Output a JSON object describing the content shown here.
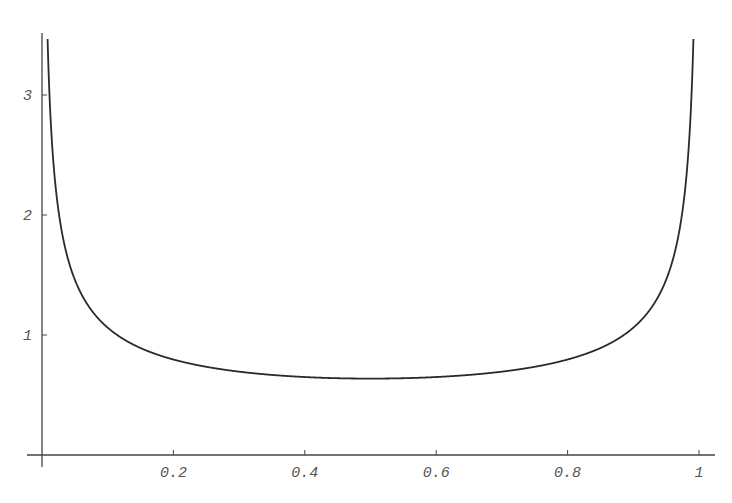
{
  "chart_data": {
    "type": "line",
    "title": "",
    "xlabel": "",
    "ylabel": "",
    "function": "1/(pi*sqrt(x*(1-x)))",
    "xlim": [
      0,
      1
    ],
    "ylim": [
      0,
      3.5
    ],
    "grid": false,
    "legend": null,
    "x_ticks": [
      {
        "value": 0.2,
        "label": "0.2"
      },
      {
        "value": 0.4,
        "label": "0.4"
      },
      {
        "value": 0.6,
        "label": "0.6"
      },
      {
        "value": 0.8,
        "label": "0.8"
      },
      {
        "value": 1,
        "label": "1"
      }
    ],
    "y_ticks": [
      {
        "value": 1,
        "label": "1"
      },
      {
        "value": 2,
        "label": "2"
      },
      {
        "value": 3,
        "label": "3"
      }
    ],
    "series": [
      {
        "name": "curve",
        "x": [
          0.01,
          0.02,
          0.05,
          0.1,
          0.2,
          0.3,
          0.4,
          0.5,
          0.6,
          0.7,
          0.8,
          0.9,
          0.95,
          0.98,
          0.99
        ],
        "y": [
          3.2,
          2.27,
          1.46,
          1.06,
          0.8,
          0.69,
          0.65,
          0.64,
          0.65,
          0.69,
          0.8,
          1.06,
          1.46,
          2.27,
          3.2
        ]
      }
    ],
    "colors": {
      "curve": "#2a2a2a",
      "axis": "#444444",
      "labels": "#555555"
    }
  }
}
